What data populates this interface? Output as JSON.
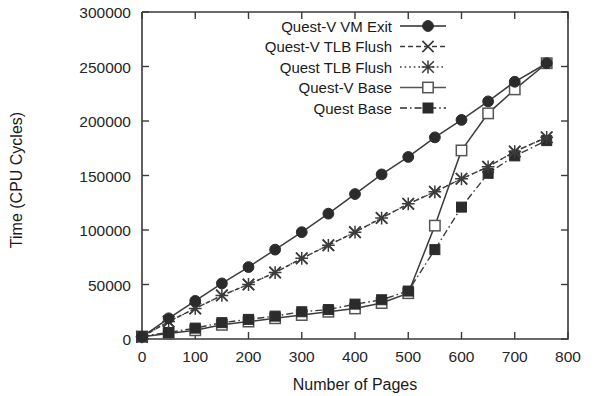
{
  "chart_data": {
    "type": "line",
    "title": "",
    "xlabel": "Number of Pages",
    "ylabel": "Time (CPU Cycles)",
    "xlim": [
      0,
      800
    ],
    "ylim": [
      0,
      300000
    ],
    "xticks": [
      0,
      100,
      200,
      300,
      400,
      500,
      600,
      700,
      800
    ],
    "xticklabels": [
      "0",
      "100",
      "200",
      "300",
      "400",
      "500",
      "600",
      "700",
      "800"
    ],
    "yticks": [
      0,
      50000,
      100000,
      150000,
      200000,
      250000,
      300000
    ],
    "yticklabels": [
      "0",
      "50000",
      "100000",
      "150000",
      "200000",
      "250000",
      "300000"
    ],
    "grid": false,
    "legend_position": "top-center",
    "series": [
      {
        "name": "Quest-V VM Exit",
        "marker": "filled-circle",
        "linestyle": "solid",
        "color": "#2b2b2b",
        "x": [
          0,
          50,
          100,
          150,
          200,
          250,
          300,
          350,
          400,
          450,
          500,
          550,
          600,
          650,
          700,
          760
        ],
        "values": [
          2000,
          19000,
          35000,
          51000,
          66000,
          82000,
          98000,
          115000,
          133000,
          151000,
          167000,
          185000,
          201000,
          218000,
          236000,
          253000
        ]
      },
      {
        "name": "Quest-V TLB Flush",
        "marker": "x-cross",
        "linestyle": "dashed",
        "color": "#3c3c3c",
        "x": [
          0,
          50,
          100,
          150,
          200,
          250,
          300,
          350,
          400,
          450,
          500,
          550,
          600,
          650,
          700,
          760
        ],
        "values": [
          2000,
          16000,
          28000,
          40000,
          50000,
          61000,
          74000,
          86000,
          98000,
          111000,
          124000,
          135000,
          147000,
          158000,
          172000,
          185000
        ]
      },
      {
        "name": "Quest TLB Flush",
        "marker": "star-cross",
        "linestyle": "dotted",
        "color": "#3c3c3c",
        "x": [
          0,
          50,
          100,
          150,
          200,
          250,
          300,
          350,
          400,
          450,
          500,
          550,
          600,
          650,
          700,
          760
        ],
        "values": [
          2000,
          16000,
          28000,
          40000,
          50000,
          61000,
          74000,
          86000,
          98000,
          111000,
          124000,
          135000,
          147000,
          158000,
          172000,
          185000
        ]
      },
      {
        "name": "Quest-V Base",
        "marker": "open-square",
        "linestyle": "solid",
        "color": "#555555",
        "x": [
          0,
          50,
          100,
          150,
          200,
          250,
          300,
          350,
          400,
          450,
          500,
          550,
          600,
          650,
          700,
          760
        ],
        "values": [
          2000,
          5000,
          8000,
          13000,
          16000,
          19000,
          22000,
          25000,
          28000,
          33000,
          42000,
          104000,
          173000,
          207000,
          229000,
          253000
        ]
      },
      {
        "name": "Quest Base",
        "marker": "filled-square",
        "linestyle": "dashdot",
        "color": "#2b2b2b",
        "x": [
          0,
          50,
          100,
          150,
          200,
          250,
          300,
          350,
          400,
          450,
          500,
          550,
          600,
          650,
          700,
          760
        ],
        "values": [
          2500,
          6000,
          10000,
          15000,
          18000,
          21000,
          25000,
          27000,
          32000,
          36000,
          44000,
          82000,
          121000,
          152000,
          168000,
          182000
        ]
      }
    ]
  },
  "legend": {
    "items": [
      {
        "label": "Quest-V VM Exit"
      },
      {
        "label": "Quest-V TLB Flush"
      },
      {
        "label": "Quest TLB Flush"
      },
      {
        "label": "Quest-V Base"
      },
      {
        "label": "Quest Base"
      }
    ]
  }
}
